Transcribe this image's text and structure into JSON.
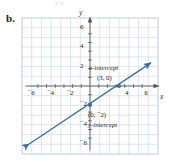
{
  "part_label": "b.",
  "crop_top_text": "y                                      x",
  "colors": {
    "line": "#3a6ea5",
    "grid": "#c9d3e0",
    "axis": "#58595b",
    "text": "#231f20"
  },
  "axis_names": {
    "x": "x",
    "y": "y"
  },
  "annotations": {
    "x_intercept_label": "x-intercept",
    "x_intercept_point": "(3, 0)",
    "y_intercept_point": "(0, ¯2)",
    "y_intercept_label": "y-intercept"
  },
  "chart_data": {
    "type": "line",
    "title": "",
    "xlabel": "x",
    "ylabel": "y",
    "xlim": [
      -7,
      7
    ],
    "ylim": [
      -7,
      7
    ],
    "grid": true,
    "grid_step": 1,
    "legend": "none",
    "x_ticks": [
      -6,
      -4,
      -2,
      4,
      6
    ],
    "x_tick_labels": [
      "¯6",
      "¯4",
      "¯2",
      "4",
      "6"
    ],
    "y_ticks": [
      6,
      4,
      2,
      -2,
      -4,
      -6
    ],
    "y_tick_labels": [
      "6",
      "4",
      "2",
      "¯2",
      "¯4",
      "¯6"
    ],
    "series": [
      {
        "name": "line",
        "equation": "y = (2/3)x - 2",
        "slope": 0.6667,
        "intercept": -2,
        "x": [
          -7,
          7
        ],
        "values": [
          -6.6667,
          2.6667
        ],
        "arrows": "both",
        "color": "#3a6ea5"
      }
    ],
    "points": [
      {
        "label": "x-intercept",
        "x": 3,
        "y": 0,
        "display": "(3, 0)"
      },
      {
        "label": "y-intercept",
        "x": 0,
        "y": -2,
        "display": "(0, ¯2)"
      }
    ]
  }
}
